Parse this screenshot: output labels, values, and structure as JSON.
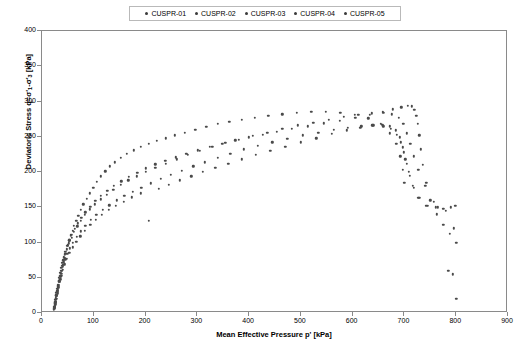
{
  "chart_data": {
    "type": "scatter",
    "title": "",
    "xlabel": "Mean Effective Pressure p' [kPa]",
    "ylabel_main": "Deviatoric Stress q",
    "ylabel_sub": "=σ'",
    "ylabel_rest": "-σ'",
    "ylabel_full": "Deviatoric Stress q=σ'₁-σ'₃ [kPa]",
    "xlim": [
      0,
      900
    ],
    "ylim": [
      0,
      400
    ],
    "xticks": [
      0,
      100,
      200,
      300,
      400,
      500,
      600,
      700,
      800,
      900
    ],
    "yticks": [
      0,
      50,
      100,
      150,
      200,
      250,
      300,
      350,
      400
    ],
    "grid": false,
    "legend_position": "top-center",
    "marker_color": "#4a4a4a",
    "legend": [
      {
        "label": "CUSPR-01",
        "color": "#3a3a3a"
      },
      {
        "label": "CUSPR-02",
        "color": "#3a3a3a"
      },
      {
        "label": "CUSPR-03",
        "color": "#3a3a3a"
      },
      {
        "label": "CUSPR-04",
        "color": "#3a3a3a"
      },
      {
        "label": "CUSPR-05",
        "color": "#3a3a3a"
      }
    ],
    "series": [
      {
        "name": "CUSPR-01",
        "points": [
          [
            25,
            8
          ],
          [
            26,
            12
          ],
          [
            27,
            16
          ],
          [
            28,
            20
          ],
          [
            29,
            24
          ],
          [
            30,
            28
          ],
          [
            31,
            32
          ],
          [
            32,
            36
          ],
          [
            33,
            40
          ],
          [
            34,
            44
          ],
          [
            35,
            48
          ],
          [
            36,
            52
          ],
          [
            37,
            56
          ],
          [
            38,
            60
          ],
          [
            40,
            66
          ],
          [
            42,
            72
          ],
          [
            44,
            78
          ],
          [
            46,
            84
          ],
          [
            48,
            90
          ],
          [
            50,
            96
          ],
          [
            53,
            103
          ],
          [
            56,
            110
          ],
          [
            59,
            117
          ],
          [
            62,
            124
          ],
          [
            66,
            131
          ],
          [
            70,
            138
          ],
          [
            75,
            146
          ],
          [
            80,
            154
          ],
          [
            86,
            162
          ],
          [
            92,
            170
          ],
          [
            99,
            178
          ],
          [
            106,
            186
          ],
          [
            114,
            194
          ],
          [
            122,
            201
          ],
          [
            131,
            208
          ],
          [
            141,
            214
          ],
          [
            152,
            220
          ],
          [
            164,
            226
          ],
          [
            177,
            231
          ],
          [
            191,
            236
          ],
          [
            206,
            240
          ],
          [
            222,
            244
          ],
          [
            239,
            248
          ],
          [
            257,
            252
          ],
          [
            276,
            256
          ],
          [
            296,
            260
          ],
          [
            317,
            264
          ],
          [
            339,
            268
          ],
          [
            362,
            271
          ],
          [
            386,
            274
          ],
          [
            411,
            277
          ],
          [
            437,
            280
          ],
          [
            464,
            282
          ],
          [
            492,
            284
          ],
          [
            520,
            285
          ],
          [
            548,
            285
          ],
          [
            576,
            284
          ],
          [
            604,
            281
          ],
          [
            630,
            276
          ],
          [
            654,
            268
          ],
          [
            672,
            255
          ],
          [
            684,
            240
          ],
          [
            692,
            222
          ],
          [
            697,
            203
          ],
          [
            700,
            185
          ]
        ]
      },
      {
        "name": "CUSPR-02",
        "points": [
          [
            24,
            6
          ],
          [
            25,
            10
          ],
          [
            26,
            15
          ],
          [
            27,
            20
          ],
          [
            28,
            25
          ],
          [
            29,
            30
          ],
          [
            30,
            35
          ],
          [
            31,
            40
          ],
          [
            32,
            45
          ],
          [
            33,
            50
          ],
          [
            35,
            57
          ],
          [
            37,
            64
          ],
          [
            39,
            71
          ],
          [
            42,
            79
          ],
          [
            45,
            87
          ],
          [
            49,
            95
          ],
          [
            53,
            103
          ],
          [
            58,
            111
          ],
          [
            63,
            119
          ],
          [
            69,
            127
          ],
          [
            76,
            135
          ],
          [
            84,
            143
          ],
          [
            93,
            151
          ],
          [
            103,
            159
          ],
          [
            114,
            166
          ],
          [
            126,
            173
          ],
          [
            139,
            180
          ],
          [
            153,
            187
          ],
          [
            168,
            193
          ],
          [
            184,
            199
          ],
          [
            201,
            205
          ],
          [
            219,
            211
          ],
          [
            238,
            216
          ],
          [
            258,
            221
          ],
          [
            279,
            226
          ],
          [
            301,
            231
          ],
          [
            324,
            236
          ],
          [
            348,
            240
          ],
          [
            373,
            245
          ],
          [
            399,
            249
          ],
          [
            426,
            253
          ],
          [
            454,
            257
          ],
          [
            483,
            261
          ],
          [
            513,
            265
          ],
          [
            544,
            269
          ],
          [
            575,
            273
          ],
          [
            605,
            277
          ],
          [
            633,
            281
          ],
          [
            658,
            285
          ],
          [
            678,
            289
          ],
          [
            694,
            292
          ],
          [
            706,
            294
          ],
          [
            714,
            293
          ],
          [
            719,
            288
          ],
          [
            723,
            280
          ],
          [
            726,
            268
          ],
          [
            729,
            252
          ],
          [
            732,
            232
          ],
          [
            736,
            210
          ],
          [
            742,
            185
          ],
          [
            750,
            160
          ],
          [
            762,
            140
          ],
          [
            775,
            125
          ],
          [
            788,
            112
          ],
          [
            800,
            100
          ]
        ]
      },
      {
        "name": "CUSPR-03",
        "points": [
          [
            23,
            5
          ],
          [
            24,
            9
          ],
          [
            25,
            14
          ],
          [
            26,
            19
          ],
          [
            27,
            24
          ],
          [
            28,
            29
          ],
          [
            29,
            34
          ],
          [
            30,
            39
          ],
          [
            32,
            46
          ],
          [
            34,
            53
          ],
          [
            36,
            60
          ],
          [
            38,
            67
          ],
          [
            41,
            75
          ],
          [
            44,
            83
          ],
          [
            48,
            91
          ],
          [
            52,
            99
          ],
          [
            57,
            107
          ],
          [
            62,
            115
          ],
          [
            68,
            123
          ],
          [
            75,
            131
          ],
          [
            83,
            139
          ],
          [
            92,
            147
          ],
          [
            102,
            154
          ],
          [
            113,
            161
          ],
          [
            125,
            168
          ],
          [
            138,
            175
          ],
          [
            152,
            182
          ],
          [
            167,
            188
          ],
          [
            183,
            194
          ],
          [
            200,
            200
          ],
          [
            219,
            206
          ],
          [
            239,
            212
          ],
          [
            260,
            218
          ],
          [
            282,
            224
          ],
          [
            305,
            230
          ],
          [
            329,
            236
          ],
          [
            354,
            241
          ],
          [
            380,
            246
          ],
          [
            407,
            251
          ],
          [
            435,
            256
          ],
          [
            464,
            261
          ],
          [
            494,
            266
          ],
          [
            524,
            270
          ],
          [
            554,
            274
          ],
          [
            583,
            278
          ],
          [
            611,
            281
          ],
          [
            637,
            283
          ],
          [
            659,
            284
          ],
          [
            676,
            282
          ],
          [
            689,
            277
          ],
          [
            698,
            268
          ],
          [
            705,
            255
          ],
          [
            711,
            240
          ],
          [
            718,
            222
          ],
          [
            727,
            203
          ],
          [
            740,
            180
          ],
          [
            757,
            158
          ],
          [
            775,
            148
          ],
          [
            790,
            150
          ],
          [
            798,
            152
          ]
        ]
      },
      {
        "name": "CUSPR-04",
        "points": [
          [
            24,
            7
          ],
          [
            25,
            11
          ],
          [
            26,
            16
          ],
          [
            27,
            21
          ],
          [
            28,
            26
          ],
          [
            29,
            31
          ],
          [
            31,
            38
          ],
          [
            33,
            45
          ],
          [
            35,
            52
          ],
          [
            38,
            60
          ],
          [
            41,
            68
          ],
          [
            45,
            76
          ],
          [
            49,
            84
          ],
          [
            54,
            92
          ],
          [
            60,
            100
          ],
          [
            67,
            108
          ],
          [
            75,
            116
          ],
          [
            84,
            124
          ],
          [
            94,
            132
          ],
          [
            105,
            139
          ],
          [
            117,
            146
          ],
          [
            130,
            153
          ],
          [
            144,
            160
          ],
          [
            159,
            166
          ],
          [
            175,
            172
          ],
          [
            192,
            178
          ],
          [
            210,
            184
          ],
          [
            229,
            190
          ],
          [
            249,
            196
          ],
          [
            270,
            202
          ],
          [
            292,
            208
          ],
          [
            315,
            214
          ],
          [
            339,
            220
          ],
          [
            364,
            226
          ],
          [
            390,
            232
          ],
          [
            417,
            237
          ],
          [
            445,
            242
          ],
          [
            474,
            247
          ],
          [
            504,
            252
          ],
          [
            534,
            256
          ],
          [
            563,
            260
          ],
          [
            591,
            263
          ],
          [
            617,
            265
          ],
          [
            640,
            266
          ],
          [
            659,
            265
          ],
          [
            674,
            261
          ],
          [
            685,
            253
          ],
          [
            693,
            242
          ],
          [
            699,
            228
          ],
          [
            704,
            212
          ],
          [
            710,
            195
          ],
          [
            718,
            178
          ],
          [
            729,
            163
          ],
          [
            745,
            152
          ],
          [
            765,
            150
          ],
          [
            785,
            60
          ],
          [
            793,
            55
          ],
          [
            800,
            20
          ]
        ]
      },
      {
        "name": "CUSPR-05",
        "points": [
          [
            25,
            9
          ],
          [
            26,
            14
          ],
          [
            27,
            19
          ],
          [
            28,
            24
          ],
          [
            30,
            31
          ],
          [
            32,
            38
          ],
          [
            34,
            45
          ],
          [
            37,
            53
          ],
          [
            40,
            61
          ],
          [
            44,
            69
          ],
          [
            48,
            77
          ],
          [
            53,
            85
          ],
          [
            59,
            93
          ],
          [
            66,
            101
          ],
          [
            74,
            109
          ],
          [
            83,
            117
          ],
          [
            93,
            125
          ],
          [
            104,
            132
          ],
          [
            116,
            139
          ],
          [
            129,
            146
          ],
          [
            143,
            152
          ],
          [
            158,
            158
          ],
          [
            174,
            164
          ],
          [
            191,
            170
          ],
          [
            206,
            131
          ],
          [
            225,
            176
          ],
          [
            245,
            182
          ],
          [
            266,
            188
          ],
          [
            288,
            194
          ],
          [
            311,
            200
          ],
          [
            335,
            206
          ],
          [
            360,
            212
          ],
          [
            386,
            218
          ],
          [
            413,
            224
          ],
          [
            441,
            230
          ],
          [
            470,
            236
          ],
          [
            500,
            242
          ],
          [
            530,
            248
          ],
          [
            560,
            254
          ],
          [
            589,
            259
          ],
          [
            615,
            263
          ],
          [
            638,
            266
          ],
          [
            657,
            267
          ],
          [
            672,
            265
          ],
          [
            683,
            259
          ],
          [
            691,
            249
          ],
          [
            697,
            235
          ],
          [
            702,
            218
          ],
          [
            708,
            200
          ],
          [
            716,
            180
          ],
          [
            727,
            163
          ],
          [
            742,
            152
          ],
          [
            760,
            150
          ],
          [
            780,
            145
          ],
          [
            795,
            120
          ]
        ]
      }
    ]
  }
}
